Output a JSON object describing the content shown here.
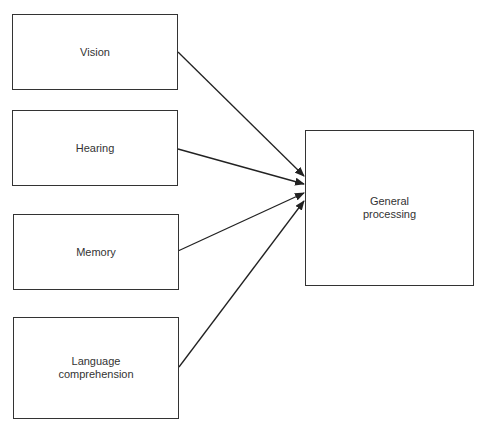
{
  "diagram": {
    "inputs": [
      {
        "label": "Vision"
      },
      {
        "label": "Hearing"
      },
      {
        "label": "Memory"
      },
      {
        "label": "Language\ncomprehension"
      }
    ],
    "output": {
      "label": "General\nprocessing"
    },
    "edges": [
      {
        "from": "Vision",
        "to": "General processing"
      },
      {
        "from": "Hearing",
        "to": "General processing"
      },
      {
        "from": "Memory",
        "to": "General processing"
      },
      {
        "from": "Language comprehension",
        "to": "General processing"
      }
    ]
  }
}
